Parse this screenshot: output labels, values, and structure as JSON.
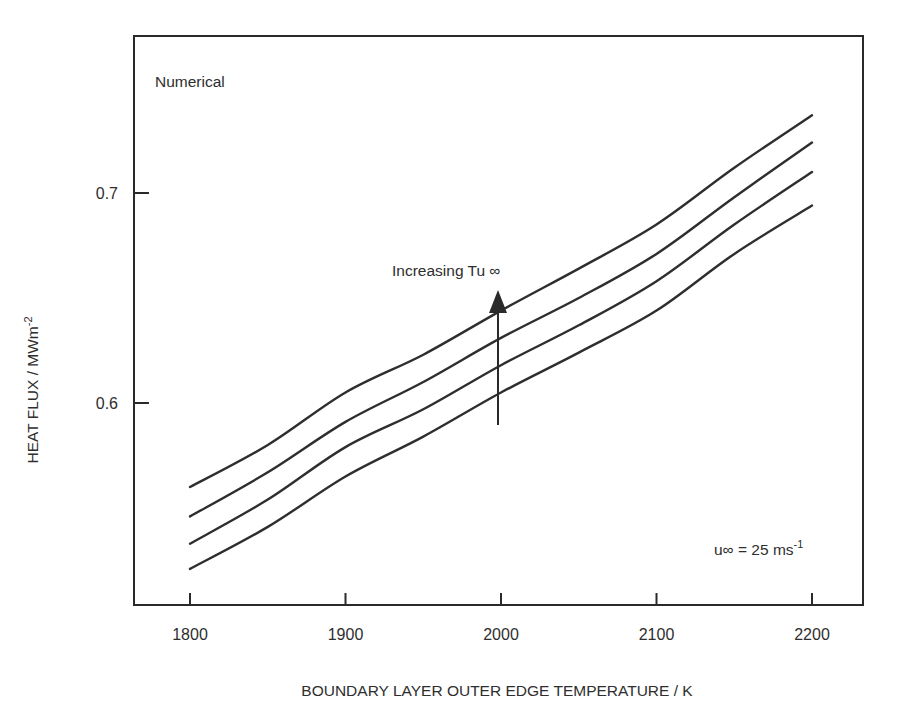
{
  "chart_data": {
    "type": "line",
    "title": "",
    "panel_label": "Numerical",
    "xlabel": "BOUNDARY LAYER OUTER EDGE TEMPERATURE / K",
    "ylabel": "HEAT FLUX / MWm-2",
    "ylabel_parts": {
      "main": "HEAT FLUX / MWm",
      "sup": "-2"
    },
    "x_ticks": [
      1800,
      1900,
      2000,
      2100,
      2200
    ],
    "x_tick_labels": [
      "1800",
      "1900",
      "2000",
      "2100",
      "2200"
    ],
    "y_ticks": [
      0.6,
      0.7
    ],
    "y_tick_labels": [
      "0.6",
      "0.7"
    ],
    "xlim": [
      1764,
      2244
    ],
    "ylim": [
      0.509,
      0.78
    ],
    "grid": false,
    "legend": null,
    "x": [
      1800,
      1850,
      1900,
      1950,
      2000,
      2050,
      2100,
      2150,
      2200
    ],
    "series": [
      {
        "name": "Tu∞ level 4 (highest)",
        "values": [
          0.56,
          0.58,
          0.605,
          0.623,
          0.644,
          0.664,
          0.685,
          0.712,
          0.737
        ]
      },
      {
        "name": "Tu∞ level 3",
        "values": [
          0.546,
          0.567,
          0.591,
          0.61,
          0.631,
          0.65,
          0.671,
          0.698,
          0.724
        ]
      },
      {
        "name": "Tu∞ level 2",
        "values": [
          0.533,
          0.554,
          0.579,
          0.597,
          0.618,
          0.637,
          0.658,
          0.685,
          0.71
        ]
      },
      {
        "name": "Tu∞ level 1 (lowest)",
        "values": [
          0.521,
          0.541,
          0.565,
          0.584,
          0.605,
          0.624,
          0.644,
          0.671,
          0.694
        ]
      }
    ],
    "annotations": [
      {
        "text": "Increasing Tu ∞",
        "type": "arrow",
        "x": 1995,
        "y_from": 0.589,
        "y_to": 0.653
      },
      {
        "text": "u∞ = 25 ms-1",
        "main": "u∞ = 25 ms",
        "sup": "-1"
      }
    ],
    "colors": {
      "line": "#2e2e2e",
      "axis": "#2a2a2a",
      "background": "#ffffff"
    }
  }
}
